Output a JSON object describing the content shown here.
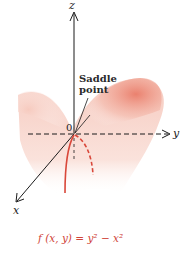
{
  "figure": {
    "axes": {
      "x_label": "x",
      "y_label": "y",
      "z_label": "z",
      "origin_label": "0"
    },
    "annotation": {
      "line1": "Saddle",
      "line2": "point"
    },
    "caption": "f (x, y) = y² − x²",
    "colors": {
      "surface": "#e8735f",
      "curve": "#d9473a",
      "axis": "#1a1a1a",
      "caption": "#d0453a"
    }
  }
}
